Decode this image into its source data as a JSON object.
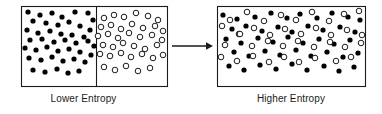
{
  "figure": {
    "title_absent": true,
    "type": "entropy-diagram",
    "stroke_color": "#1a1a1a",
    "fill_filled": "#000000",
    "fill_open": "#ffffff",
    "background": "#ffffff"
  },
  "captions": {
    "left": "Lower Entropy",
    "right": "Higher Entropy"
  },
  "arrow": {
    "label": "",
    "x1": 172,
    "y1": 46,
    "x2": 212,
    "y2": 46
  },
  "left_box": {
    "x": 21,
    "y": 6,
    "width": 146,
    "height": 80,
    "divider_x": 96,
    "filled_count": 44,
    "open_count": 38
  },
  "right_box": {
    "x": 217,
    "y": 6,
    "width": 148,
    "height": 80,
    "filled_count": 43,
    "open_count": 39
  },
  "chart_data": {
    "type": "scatter",
    "xlabel": "",
    "ylabel": "",
    "legend": [
      "filled particle",
      "open particle"
    ],
    "panels": [
      {
        "name": "Lower Entropy",
        "caption": "Lower Entropy",
        "bounds": {
          "x": 21,
          "y": 6,
          "w": 146,
          "h": 80
        },
        "divider_x": 96,
        "series": [
          {
            "name": "filled",
            "marker": "filled-circle",
            "radius": 2.6,
            "points": [
              [
                28,
                12
              ],
              [
                40,
                15
              ],
              [
                52,
                13
              ],
              [
                62,
                17
              ],
              [
                75,
                12
              ],
              [
                88,
                13
              ],
              [
                93,
                20
              ],
              [
                33,
                21
              ],
              [
                46,
                23
              ],
              [
                58,
                25
              ],
              [
                69,
                22
              ],
              [
                80,
                26
              ],
              [
                90,
                30
              ],
              [
                27,
                30
              ],
              [
                38,
                33
              ],
              [
                50,
                31
              ],
              [
                61,
                34
              ],
              [
                72,
                35
              ],
              [
                84,
                37
              ],
              [
                30,
                40
              ],
              [
                42,
                39
              ],
              [
                54,
                42
              ],
              [
                65,
                40
              ],
              [
                76,
                43
              ],
              [
                88,
                41
              ],
              [
                94,
                46
              ],
              [
                25,
                48
              ],
              [
                36,
                50
              ],
              [
                47,
                47
              ],
              [
                58,
                51
              ],
              [
                69,
                49
              ],
              [
                80,
                52
              ],
              [
                91,
                55
              ],
              [
                29,
                58
              ],
              [
                41,
                60
              ],
              [
                52,
                57
              ],
              [
                63,
                61
              ],
              [
                74,
                59
              ],
              [
                85,
                62
              ],
              [
                33,
                70
              ],
              [
                45,
                72
              ],
              [
                57,
                69
              ],
              [
                68,
                73
              ],
              [
                79,
                71
              ]
            ]
          },
          {
            "name": "open",
            "marker": "open-circle",
            "radius": 2.8,
            "points": [
              [
                104,
                18
              ],
              [
                114,
                15
              ],
              [
                124,
                17
              ],
              [
                136,
                13
              ],
              [
                148,
                16
              ],
              [
                158,
                20
              ],
              [
                101,
                27
              ],
              [
                111,
                25
              ],
              [
                121,
                29
              ],
              [
                132,
                24
              ],
              [
                143,
                28
              ],
              [
                155,
                26
              ],
              [
                163,
                31
              ],
              [
                98,
                36
              ],
              [
                108,
                34
              ],
              [
                118,
                38
              ],
              [
                129,
                33
              ],
              [
                140,
                37
              ],
              [
                152,
                35
              ],
              [
                162,
                40
              ],
              [
                103,
                45
              ],
              [
                113,
                47
              ],
              [
                123,
                43
              ],
              [
                134,
                46
              ],
              [
                145,
                49
              ],
              [
                157,
                45
              ],
              [
                100,
                54
              ],
              [
                110,
                56
              ],
              [
                121,
                53
              ],
              [
                131,
                57
              ],
              [
                142,
                54
              ],
              [
                153,
                58
              ],
              [
                163,
                55
              ],
              [
                104,
                67
              ],
              [
                115,
                70
              ],
              [
                126,
                66
              ],
              [
                138,
                71
              ],
              [
                150,
                68
              ]
            ]
          }
        ]
      },
      {
        "name": "Higher Entropy",
        "caption": "Higher Entropy",
        "bounds": {
          "x": 217,
          "y": 6,
          "w": 148,
          "h": 80
        },
        "divider_x": null,
        "series": [
          {
            "name": "filled",
            "marker": "filled-circle",
            "radius": 2.6,
            "points": [
              [
                223,
                15
              ],
              [
                237,
                19
              ],
              [
                255,
                17
              ],
              [
                271,
                13
              ],
              [
                287,
                18
              ],
              [
                300,
                14
              ],
              [
                317,
                18
              ],
              [
                332,
                13
              ],
              [
                348,
                17
              ],
              [
                360,
                20
              ],
              [
                232,
                29
              ],
              [
                246,
                26
              ],
              [
                262,
                31
              ],
              [
                278,
                27
              ],
              [
                292,
                32
              ],
              [
                308,
                26
              ],
              [
                323,
                30
              ],
              [
                340,
                27
              ],
              [
                355,
                32
              ],
              [
                226,
                39
              ],
              [
                241,
                43
              ],
              [
                258,
                38
              ],
              [
                273,
                42
              ],
              [
                288,
                37
              ],
              [
                303,
                43
              ],
              [
                319,
                39
              ],
              [
                334,
                44
              ],
              [
                350,
                40
              ],
              [
                234,
                52
              ],
              [
                249,
                56
              ],
              [
                265,
                51
              ],
              [
                280,
                55
              ],
              [
                296,
                50
              ],
              [
                311,
                56
              ],
              [
                327,
                52
              ],
              [
                343,
                57
              ],
              [
                358,
                53
              ],
              [
                229,
                66
              ],
              [
                244,
                70
              ],
              [
                260,
                65
              ],
              [
                276,
                69
              ],
              [
                292,
                64
              ],
              [
                307,
                70
              ],
              [
                324,
                66
              ],
              [
                339,
                71
              ],
              [
                354,
                67
              ]
            ]
          },
          {
            "name": "open",
            "marker": "open-circle",
            "radius": 2.8,
            "points": [
              [
                230,
                20
              ],
              [
                247,
                12
              ],
              [
                264,
                21
              ],
              [
                281,
                15
              ],
              [
                296,
                20
              ],
              [
                312,
                12
              ],
              [
                329,
                21
              ],
              [
                344,
                14
              ],
              [
                359,
                11
              ],
              [
                222,
                26
              ],
              [
                239,
                34
              ],
              [
                254,
                28
              ],
              [
                270,
                35
              ],
              [
                285,
                29
              ],
              [
                301,
                34
              ],
              [
                316,
                28
              ],
              [
                331,
                35
              ],
              [
                347,
                30
              ],
              [
                362,
                35
              ],
              [
                225,
                45
              ],
              [
                240,
                34
              ],
              [
                252,
                46
              ],
              [
                268,
                41
              ],
              [
                283,
                46
              ],
              [
                298,
                41
              ],
              [
                314,
                47
              ],
              [
                330,
                42
              ],
              [
                345,
                47
              ],
              [
                361,
                43
              ],
              [
                221,
                57
              ],
              [
                237,
                61
              ],
              [
                253,
                56
              ],
              [
                269,
                62
              ],
              [
                284,
                57
              ],
              [
                299,
                62
              ],
              [
                315,
                58
              ],
              [
                336,
                61
              ],
              [
                351,
                57
              ]
            ]
          }
        ]
      }
    ],
    "annotations": [
      {
        "type": "arrow",
        "from": [
          172,
          46
        ],
        "to": [
          212,
          46
        ],
        "text": ""
      }
    ]
  }
}
